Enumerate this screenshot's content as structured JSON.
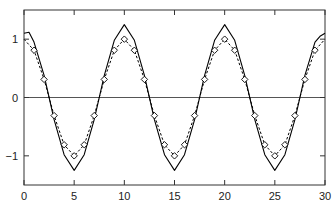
{
  "chart_data": {
    "type": "line",
    "title": "",
    "xlabel": "",
    "ylabel": "",
    "xlim": [
      0,
      30
    ],
    "ylim": [
      -1.5,
      1.5
    ],
    "grid": false,
    "legend": null,
    "x_ticks": [
      0,
      5,
      10,
      15,
      20,
      25,
      30
    ],
    "x_tick_labels": [
      "0",
      "5",
      "10",
      "15",
      "20",
      "25",
      "30"
    ],
    "y_ticks": [
      -1,
      0,
      1
    ],
    "y_tick_labels": [
      "−1",
      "0",
      "1"
    ],
    "reference_line": {
      "y": 0,
      "color": "#000000"
    },
    "series": [
      {
        "name": "solid",
        "style": "solid",
        "color": "#000000",
        "x": [
          0,
          0.5,
          1,
          2,
          3,
          4,
          5,
          6,
          7,
          8,
          9,
          10,
          11,
          12,
          13,
          14,
          15,
          16,
          17,
          18,
          19,
          20,
          21,
          22,
          23,
          24,
          25,
          26,
          27,
          28,
          29,
          29.5,
          30
        ],
        "values": [
          1.1,
          1.12,
          0.95,
          0.38,
          -0.38,
          -0.98,
          -1.25,
          -0.98,
          -0.38,
          0.38,
          0.98,
          1.25,
          0.98,
          0.38,
          -0.38,
          -0.98,
          -1.25,
          -0.98,
          -0.38,
          0.38,
          0.98,
          1.25,
          0.98,
          0.38,
          -0.38,
          -0.98,
          -1.25,
          -0.98,
          -0.38,
          0.38,
          0.95,
          1.05,
          1.1
        ]
      },
      {
        "name": "dashed",
        "style": "dashed",
        "color": "#000000",
        "x": [
          0,
          1,
          2,
          3,
          4,
          5,
          6,
          7,
          8,
          9,
          10,
          11,
          12,
          13,
          14,
          15,
          16,
          17,
          18,
          19,
          20,
          21,
          22,
          23,
          24,
          25,
          26,
          27,
          28,
          29,
          30
        ],
        "values": [
          1.0,
          0.81,
          0.31,
          -0.31,
          -0.81,
          -1.0,
          -0.81,
          -0.31,
          0.31,
          0.81,
          1.0,
          0.81,
          0.31,
          -0.31,
          -0.81,
          -1.0,
          -0.81,
          -0.31,
          0.31,
          0.81,
          1.0,
          0.81,
          0.31,
          -0.31,
          -0.81,
          -1.0,
          -0.81,
          -0.31,
          0.31,
          0.81,
          1.0
        ]
      },
      {
        "name": "samples",
        "style": "markers",
        "marker": "diamond",
        "color": "#000000",
        "x": [
          1,
          2,
          3,
          4,
          5,
          6,
          7,
          8,
          9,
          10,
          11,
          12,
          13,
          14,
          15,
          16,
          17,
          18,
          19,
          20,
          21,
          22,
          23,
          24,
          25,
          26,
          27,
          28,
          29
        ],
        "values": [
          0.81,
          0.31,
          -0.31,
          -0.81,
          -1.0,
          -0.81,
          -0.31,
          0.31,
          0.81,
          1.0,
          0.81,
          0.31,
          -0.31,
          -0.81,
          -1.0,
          -0.81,
          -0.31,
          0.31,
          0.81,
          1.0,
          0.81,
          0.31,
          -0.31,
          -0.81,
          -1.0,
          -0.81,
          -0.31,
          0.31,
          0.81
        ]
      }
    ]
  },
  "layout": {
    "plot_left": 24,
    "plot_right": 325,
    "plot_top": 10,
    "plot_bottom": 185
  }
}
